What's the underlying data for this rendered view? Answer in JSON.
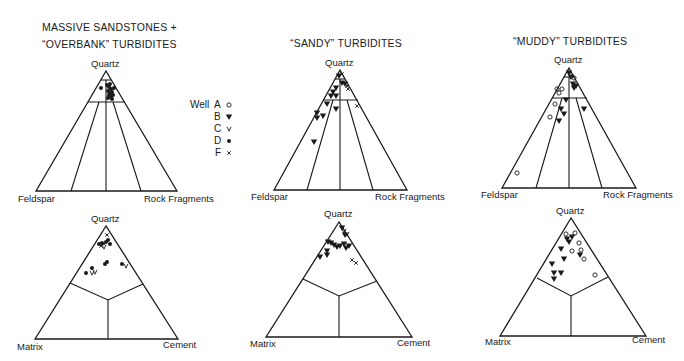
{
  "figure": {
    "column_titles": [
      {
        "line1": "MASSIVE SANDSTONES +",
        "line2": "“OVERBANK” TURBIDITES"
      },
      {
        "line1": "“SANDY” TURBIDITES",
        "line2": ""
      },
      {
        "line1": "“MUDDY” TURBIDITES",
        "line2": ""
      }
    ],
    "top_labels": {
      "apex": "Quartz",
      "left": "Feldspar",
      "right": "Rock Fragments"
    },
    "bottom_labels": {
      "apex": "Quartz",
      "left": "Matrix",
      "right": "Cement"
    },
    "legend": {
      "title": "Well",
      "items": [
        {
          "well": "A",
          "symbol": "open-circle",
          "glyph": "o"
        },
        {
          "well": "B",
          "symbol": "filled-triangle-down",
          "glyph": "▼"
        },
        {
          "well": "C",
          "symbol": "v-mark",
          "glyph": "v"
        },
        {
          "well": "D",
          "symbol": "filled-circle",
          "glyph": "•"
        },
        {
          "well": "F",
          "symbol": "cross",
          "glyph": "×"
        }
      ]
    }
  },
  "chart_data": [
    {
      "type": "scatter",
      "subtype": "ternary",
      "title": "MASSIVE SANDSTONES + “OVERBANK” TURBIDITES",
      "axes": [
        "Quartz",
        "Feldspar",
        "Rock Fragments"
      ],
      "points_px": [
        {
          "well": "D",
          "x": 101,
          "y": 88
        },
        {
          "well": "D",
          "x": 107,
          "y": 85
        },
        {
          "well": "D",
          "x": 109,
          "y": 87
        },
        {
          "well": "D",
          "x": 111,
          "y": 89
        },
        {
          "well": "D",
          "x": 108,
          "y": 91
        },
        {
          "well": "D",
          "x": 110,
          "y": 93
        },
        {
          "well": "D",
          "x": 112,
          "y": 92
        },
        {
          "well": "D",
          "x": 109,
          "y": 95
        },
        {
          "well": "D",
          "x": 111,
          "y": 97
        },
        {
          "well": "D",
          "x": 108,
          "y": 98
        },
        {
          "well": "D",
          "x": 113,
          "y": 95
        },
        {
          "well": "D",
          "x": 110,
          "y": 84
        },
        {
          "well": "D",
          "x": 114,
          "y": 88
        },
        {
          "well": "D",
          "x": 112,
          "y": 99
        }
      ]
    },
    {
      "type": "scatter",
      "subtype": "ternary",
      "title": "“SANDY” TURBIDITES",
      "axes": [
        "Quartz",
        "Feldspar",
        "Rock Fragments"
      ],
      "points_px": [
        {
          "well": "B",
          "x": 339,
          "y": 76
        },
        {
          "well": "F",
          "x": 342,
          "y": 74
        },
        {
          "well": "B",
          "x": 342,
          "y": 83
        },
        {
          "well": "B",
          "x": 345,
          "y": 84
        },
        {
          "well": "F",
          "x": 347,
          "y": 86
        },
        {
          "well": "F",
          "x": 348,
          "y": 89
        },
        {
          "well": "B",
          "x": 336,
          "y": 88
        },
        {
          "well": "B",
          "x": 333,
          "y": 92
        },
        {
          "well": "B",
          "x": 331,
          "y": 96
        },
        {
          "well": "B",
          "x": 336,
          "y": 96
        },
        {
          "well": "B",
          "x": 327,
          "y": 104
        },
        {
          "well": "B",
          "x": 336,
          "y": 109
        },
        {
          "well": "F",
          "x": 357,
          "y": 106
        },
        {
          "well": "B",
          "x": 317,
          "y": 113
        },
        {
          "well": "B",
          "x": 323,
          "y": 116
        },
        {
          "well": "B",
          "x": 317,
          "y": 118
        },
        {
          "well": "B",
          "x": 314,
          "y": 142
        }
      ]
    },
    {
      "type": "scatter",
      "subtype": "ternary",
      "title": "“MUDDY” TURBIDITES",
      "axes": [
        "Quartz",
        "Feldspar",
        "Rock Fragments"
      ],
      "points_px": [
        {
          "well": "B",
          "x": 569,
          "y": 73
        },
        {
          "well": "B",
          "x": 571,
          "y": 77
        },
        {
          "well": "A",
          "x": 574,
          "y": 78
        },
        {
          "well": "B",
          "x": 573,
          "y": 84
        },
        {
          "well": "B",
          "x": 574,
          "y": 88
        },
        {
          "well": "B",
          "x": 576,
          "y": 86
        },
        {
          "well": "A",
          "x": 557,
          "y": 89
        },
        {
          "well": "A",
          "x": 562,
          "y": 89
        },
        {
          "well": "A",
          "x": 559,
          "y": 93
        },
        {
          "well": "B",
          "x": 566,
          "y": 100
        },
        {
          "well": "A",
          "x": 555,
          "y": 104
        },
        {
          "well": "B",
          "x": 561,
          "y": 109
        },
        {
          "well": "B",
          "x": 564,
          "y": 114
        },
        {
          "well": "B",
          "x": 584,
          "y": 109
        },
        {
          "well": "A",
          "x": 550,
          "y": 117
        },
        {
          "well": "B",
          "x": 559,
          "y": 121
        },
        {
          "well": "A",
          "x": 517,
          "y": 173
        }
      ]
    },
    {
      "type": "scatter",
      "subtype": "ternary",
      "title": "MASSIVE SANDSTONES + “OVERBANK” TURBIDITES (Q-M-C)",
      "axes": [
        "Quartz",
        "Matrix",
        "Cement"
      ],
      "points_px": [
        {
          "well": "F",
          "x": 107,
          "y": 235
        },
        {
          "well": "D",
          "x": 99,
          "y": 244
        },
        {
          "well": "D",
          "x": 102,
          "y": 243
        },
        {
          "well": "F",
          "x": 104,
          "y": 244
        },
        {
          "well": "D",
          "x": 106,
          "y": 242
        },
        {
          "well": "D",
          "x": 108,
          "y": 240
        },
        {
          "well": "F",
          "x": 101,
          "y": 246
        },
        {
          "well": "C",
          "x": 104,
          "y": 247
        },
        {
          "well": "D",
          "x": 110,
          "y": 244
        },
        {
          "well": "D",
          "x": 105,
          "y": 264
        },
        {
          "well": "D",
          "x": 107,
          "y": 262
        },
        {
          "well": "D",
          "x": 122,
          "y": 264
        },
        {
          "well": "C",
          "x": 126,
          "y": 266
        },
        {
          "well": "D",
          "x": 92,
          "y": 268
        },
        {
          "well": "D",
          "x": 86,
          "y": 273
        },
        {
          "well": "C",
          "x": 92,
          "y": 273
        },
        {
          "well": "C",
          "x": 95,
          "y": 272
        }
      ]
    },
    {
      "type": "scatter",
      "subtype": "ternary",
      "title": "“SANDY” TURBIDITES (Q-M-C)",
      "axes": [
        "Quartz",
        "Matrix",
        "Cement"
      ],
      "points_px": [
        {
          "well": "B",
          "x": 342,
          "y": 228
        },
        {
          "well": "C",
          "x": 344,
          "y": 231
        },
        {
          "well": "B",
          "x": 345,
          "y": 235
        },
        {
          "well": "C",
          "x": 347,
          "y": 234
        },
        {
          "well": "B",
          "x": 328,
          "y": 242
        },
        {
          "well": "B",
          "x": 331,
          "y": 243
        },
        {
          "well": "B",
          "x": 334,
          "y": 245
        },
        {
          "well": "B",
          "x": 337,
          "y": 247
        },
        {
          "well": "B",
          "x": 340,
          "y": 246
        },
        {
          "well": "B",
          "x": 344,
          "y": 244
        },
        {
          "well": "B",
          "x": 346,
          "y": 248
        },
        {
          "well": "B",
          "x": 349,
          "y": 246
        },
        {
          "well": "B",
          "x": 327,
          "y": 251
        },
        {
          "well": "B",
          "x": 327,
          "y": 255
        },
        {
          "well": "B",
          "x": 320,
          "y": 257
        },
        {
          "well": "F",
          "x": 352,
          "y": 260
        },
        {
          "well": "F",
          "x": 356,
          "y": 263
        }
      ]
    },
    {
      "type": "scatter",
      "subtype": "ternary",
      "title": "“MUDDY” TURBIDITES (Q-M-C)",
      "axes": [
        "Quartz",
        "Matrix",
        "Cement"
      ],
      "points_px": [
        {
          "well": "A",
          "x": 566,
          "y": 234
        },
        {
          "well": "A",
          "x": 575,
          "y": 233
        },
        {
          "well": "B",
          "x": 567,
          "y": 239
        },
        {
          "well": "B",
          "x": 572,
          "y": 237
        },
        {
          "well": "B",
          "x": 569,
          "y": 242
        },
        {
          "well": "A",
          "x": 579,
          "y": 243
        },
        {
          "well": "B",
          "x": 561,
          "y": 249
        },
        {
          "well": "A",
          "x": 572,
          "y": 251
        },
        {
          "well": "A",
          "x": 581,
          "y": 250
        },
        {
          "well": "B",
          "x": 580,
          "y": 255
        },
        {
          "well": "A",
          "x": 584,
          "y": 259
        },
        {
          "well": "B",
          "x": 564,
          "y": 259
        },
        {
          "well": "B",
          "x": 552,
          "y": 264
        },
        {
          "well": "B",
          "x": 554,
          "y": 273
        },
        {
          "well": "B",
          "x": 561,
          "y": 273
        },
        {
          "well": "B",
          "x": 554,
          "y": 279
        },
        {
          "well": "A",
          "x": 595,
          "y": 275
        }
      ]
    }
  ]
}
